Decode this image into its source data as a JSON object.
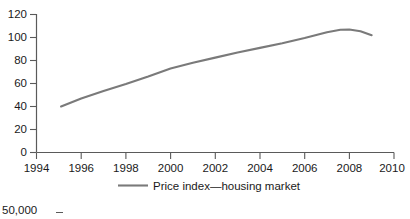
{
  "chart_data": {
    "type": "line",
    "title": "",
    "subtitle": "",
    "xlabel": "",
    "ylabel": "",
    "xlim": [
      1994,
      2010
    ],
    "ylim": [
      0,
      120
    ],
    "grid": false,
    "legend_position": "bottom-center",
    "x_ticks": [
      "1994",
      "1996",
      "1998",
      "2000",
      "2002",
      "2004",
      "2006",
      "2008",
      "2010"
    ],
    "x_tick_values": [
      1994,
      1996,
      1998,
      2000,
      2002,
      2004,
      2006,
      2008,
      2010
    ],
    "y_ticks": [
      "0",
      "20",
      "40",
      "60",
      "80",
      "100",
      "120"
    ],
    "y_tick_values": [
      0,
      20,
      40,
      60,
      80,
      100,
      120
    ],
    "series": [
      {
        "name": "Price index—housing market",
        "color": "#7a7a7a",
        "x": [
          1995.1,
          1996,
          1997,
          1998,
          1999,
          2000,
          2001,
          2002,
          2003,
          2004,
          2005,
          2006,
          2007,
          2007.6,
          2008,
          2008.5,
          2009
        ],
        "values": [
          40,
          47,
          53.5,
          59.5,
          66,
          73,
          78,
          82.5,
          87,
          91,
          95,
          99.5,
          104.5,
          106.8,
          107,
          105.5,
          102
        ]
      }
    ],
    "legend": [
      {
        "label": "Price index—housing market",
        "color": "#7a7a7a"
      }
    ],
    "annotations": []
  },
  "next_figure_fragment": {
    "partial_tick_label": "50,000"
  },
  "colors": {
    "series": "#7a7a7a",
    "axis": "#5a5a5a",
    "text": "#1a1a1a",
    "background": "#ffffff"
  }
}
